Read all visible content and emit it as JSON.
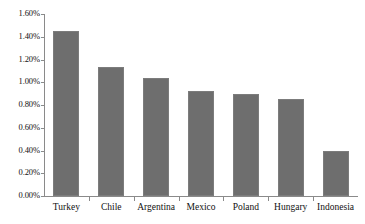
{
  "chart_data": {
    "type": "bar",
    "title": "",
    "subtitle": "",
    "xlabel": "",
    "ylabel": "",
    "categories": [
      "Turkey",
      "Chile",
      "Argentina",
      "Mexico",
      "Poland",
      "Hungary",
      "Indonesia"
    ],
    "values": [
      1.45,
      1.13,
      1.04,
      0.92,
      0.9,
      0.85,
      0.4
    ],
    "value_format": "percent",
    "ylim": [
      0.0,
      1.6
    ],
    "ytick_step": 0.2,
    "ytick_labels": [
      "1.60%",
      "1.40%",
      "1.20%",
      "1.00%",
      "0.80%",
      "0.60%",
      "0.40%",
      "0.20%",
      "0.00%"
    ],
    "ytick_values": [
      1.6,
      1.4,
      1.2,
      1.0,
      0.8,
      0.6,
      0.4,
      0.2,
      0.0
    ],
    "grid": false,
    "legend": null,
    "legend_position": "none",
    "series": [
      {
        "name": "",
        "color": "#6e6e6e",
        "values": [
          1.45,
          1.13,
          1.04,
          0.92,
          0.9,
          0.85,
          0.4
        ]
      }
    ],
    "annotations": []
  },
  "style": {
    "bar_color": "#6e6e6e",
    "bar_border_color": "#7c7c7c",
    "axis_color": "#8a8a8a",
    "text_color": "#111111",
    "background": "#ffffff"
  }
}
